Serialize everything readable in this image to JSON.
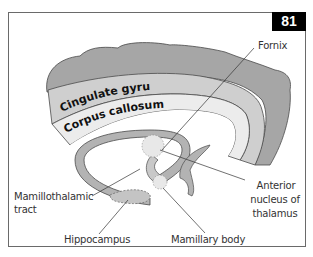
{
  "figure": {
    "number": "81",
    "labels": {
      "fornix": "Fornix",
      "cingulate_gyrus": "Cingulate gyrus",
      "corpus_callosum": "Corpus callosum",
      "mamillothalamic_tract_line1": "Mamillothalamic",
      "mamillothalamic_tract_line2": "tract",
      "hippocampus": "Hippocampus",
      "mamillary_body": "Mamillary body",
      "anterior_nucleus_line1": "Anterior",
      "anterior_nucleus_line2": "nucleus of",
      "anterior_nucleus_line3": "thalamus"
    },
    "colors": {
      "cortex": "#a6a6a6",
      "cingulate": "#cfcfcf",
      "callosum": "#ececec",
      "fornix": "#b3b3b3",
      "outline": "#4a4a4a",
      "badge_bg": "#000000",
      "badge_text": "#ffffff"
    }
  }
}
